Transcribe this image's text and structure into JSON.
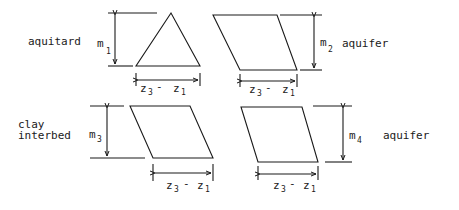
{
  "diagram": {
    "panels": [
      {
        "id": "panel-1",
        "shape": "triangle",
        "layer_label": "aquitard",
        "thickness_symbol": "m",
        "thickness_sub": "1",
        "width_label": {
          "z": "z",
          "sub_a": "3",
          "dash": "-",
          "z2": "z",
          "sub_b": "1"
        }
      },
      {
        "id": "panel-2",
        "shape": "parallelogram",
        "layer_label": "aquifer",
        "thickness_symbol": "m",
        "thickness_sub": "2",
        "width_label": {
          "z": "z",
          "sub_a": "3",
          "dash": "-",
          "z2": "z",
          "sub_b": "1"
        }
      },
      {
        "id": "panel-3",
        "shape": "parallelogram",
        "layer_label_line1": "clay",
        "layer_label_line2": "interbed",
        "thickness_symbol": "m",
        "thickness_sub": "3",
        "width_label": {
          "z": "z",
          "sub_a": "3",
          "dash": "-",
          "z2": "z",
          "sub_b": "1"
        }
      },
      {
        "id": "panel-4",
        "shape": "parallelogram",
        "layer_label": "aquifer",
        "thickness_symbol": "m",
        "thickness_sub": "4",
        "width_label": {
          "z": "z",
          "sub_a": "3",
          "dash": "-",
          "z2": "z",
          "sub_b": "1"
        }
      }
    ],
    "line_color": "#1a1a1a",
    "background": "#ffffff"
  }
}
